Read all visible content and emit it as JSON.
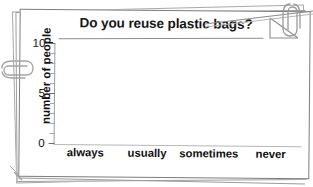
{
  "chart_data": {
    "type": "bar",
    "title": "Do you reuse plastic bags?",
    "xlabel": "",
    "ylabel": "number of people",
    "categories": [
      "always",
      "usually",
      "sometimes",
      "never"
    ],
    "values": [
      5,
      7,
      8,
      3
    ],
    "ylim": [
      0,
      10
    ],
    "ytick_labels": [
      "0",
      "5",
      "10"
    ],
    "ytick_values": [
      0,
      5,
      10
    ],
    "minor_tick_step": 1,
    "grid": false,
    "legend": false,
    "bar_colors": [
      "#a9a9a9",
      "#575757",
      "#3b3b3b",
      "#e2e2e2"
    ]
  },
  "decorations": {
    "paperclip_top_right": "paperclip-icon",
    "paperclip_left": "paperclip-icon",
    "folded_corner": "folded-corner-icon",
    "page_stack": "page-stack"
  }
}
